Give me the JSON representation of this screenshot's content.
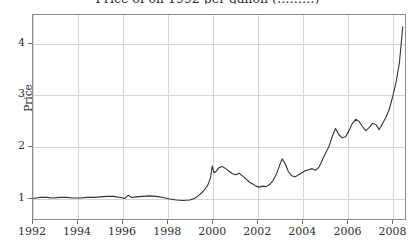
{
  "chart_data": {
    "type": "line",
    "title": "Price of oil 1992 per gallon (………)",
    "title_note": "title-cropped-at-top-edge",
    "xlabel": "",
    "ylabel": "Price",
    "xlim": [
      1992,
      2008.6
    ],
    "ylim": [
      0.58,
      4.55
    ],
    "xticks": [
      "1992",
      "1994",
      "1996",
      "1998",
      "2000",
      "2002",
      "2004",
      "2006",
      "2008"
    ],
    "xtick_values": [
      1992,
      1994,
      1996,
      1998,
      2000,
      2002,
      2004,
      2006,
      2008
    ],
    "yticks": [
      "1",
      "2",
      "3",
      "4"
    ],
    "ytick_values": [
      1,
      2,
      3,
      4
    ],
    "grid": true,
    "legend": false,
    "line_color": "#333333",
    "grid_color": "#d6d6d6",
    "frame_color": "#8d8d8d",
    "series": [
      {
        "name": "Price",
        "x": [
          1992.0,
          1992.3,
          1992.6,
          1992.9,
          1993.2,
          1993.5,
          1993.8,
          1994.1,
          1994.4,
          1994.7,
          1995.0,
          1995.3,
          1995.6,
          1995.9,
          1996.1,
          1996.25,
          1996.4,
          1996.6,
          1996.9,
          1997.2,
          1997.5,
          1997.8,
          1998.1,
          1998.4,
          1998.7,
          1999.0,
          1999.2,
          1999.4,
          1999.6,
          1999.8,
          1999.92,
          2000.0,
          2000.08,
          2000.2,
          2000.3,
          2000.45,
          2000.6,
          2000.75,
          2000.9,
          2001.05,
          2001.2,
          2001.35,
          2001.5,
          2001.65,
          2001.8,
          2001.95,
          2002.1,
          2002.25,
          2002.4,
          2002.55,
          2002.7,
          2002.85,
          2003.0,
          2003.12,
          2003.25,
          2003.4,
          2003.55,
          2003.7,
          2003.85,
          2004.0,
          2004.15,
          2004.3,
          2004.45,
          2004.6,
          2004.75,
          2004.9,
          2005.05,
          2005.2,
          2005.35,
          2005.5,
          2005.65,
          2005.8,
          2005.95,
          2006.1,
          2006.25,
          2006.4,
          2006.55,
          2006.7,
          2006.85,
          2007.0,
          2007.15,
          2007.3,
          2007.45,
          2007.6,
          2007.75,
          2007.9,
          2008.05,
          2008.2,
          2008.35,
          2008.5
        ],
        "y": [
          0.98,
          1.0,
          1.0,
          0.99,
          1.0,
          1.0,
          0.99,
          0.99,
          1.0,
          1.0,
          1.01,
          1.02,
          1.02,
          1.0,
          0.98,
          1.04,
          1.0,
          1.01,
          1.02,
          1.03,
          1.02,
          1.0,
          0.97,
          0.95,
          0.94,
          0.95,
          0.98,
          1.04,
          1.12,
          1.24,
          1.38,
          1.61,
          1.48,
          1.52,
          1.58,
          1.6,
          1.56,
          1.51,
          1.46,
          1.44,
          1.47,
          1.42,
          1.36,
          1.3,
          1.26,
          1.22,
          1.2,
          1.22,
          1.21,
          1.25,
          1.32,
          1.44,
          1.62,
          1.75,
          1.66,
          1.5,
          1.42,
          1.4,
          1.44,
          1.48,
          1.52,
          1.54,
          1.56,
          1.53,
          1.58,
          1.72,
          1.86,
          1.98,
          2.18,
          2.34,
          2.22,
          2.16,
          2.18,
          2.3,
          2.44,
          2.52,
          2.48,
          2.38,
          2.3,
          2.36,
          2.44,
          2.42,
          2.32,
          2.44,
          2.56,
          2.72,
          2.96,
          3.24,
          3.62,
          4.32
        ]
      }
    ]
  }
}
